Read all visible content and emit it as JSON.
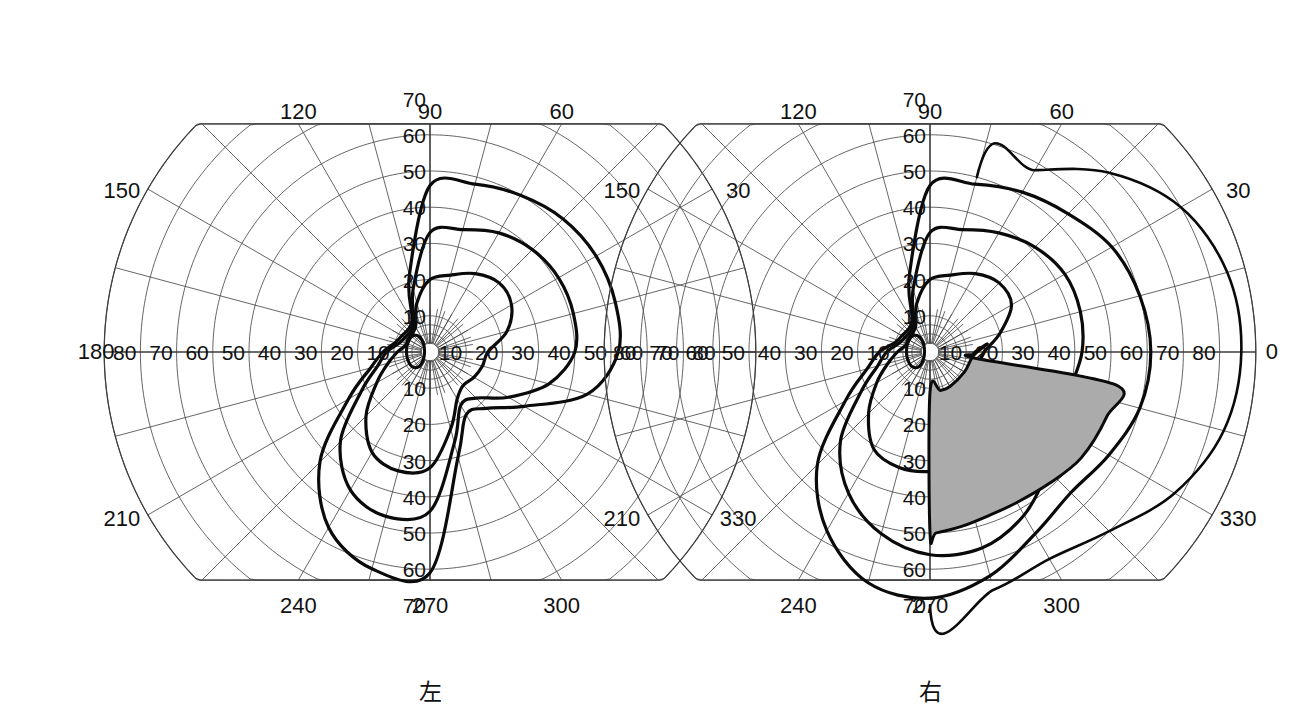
{
  "figure": {
    "background_color": "#ffffff",
    "line_color": "#3c3c3c",
    "isopter_color": "#0a0a0a",
    "scotoma_fill": "#ababab"
  },
  "panels": [
    {
      "id": "left-eye",
      "eye_label": "左",
      "eye_label_meaning": "left",
      "center_x": 430,
      "center_y": 352
    },
    {
      "id": "right-eye",
      "eye_label": "右",
      "eye_label_meaning": "right",
      "center_x": 930,
      "center_y": 352
    }
  ],
  "meridian_labels": {
    "top": [
      "120",
      "90",
      "60"
    ],
    "upper_side": [
      "150",
      "30"
    ],
    "horizontal": [
      "180",
      "0"
    ],
    "lower_side": [
      "210",
      "330"
    ],
    "bottom": [
      "240",
      "270",
      "300"
    ]
  },
  "radial_tick_labels": {
    "vertical_up": [
      "70",
      "60",
      "50",
      "40",
      "30",
      "20",
      "10"
    ],
    "vertical_down": [
      "10",
      "20",
      "30",
      "40",
      "50",
      "60",
      "70"
    ],
    "horizontal_left_panel": [
      "180",
      "80",
      "70",
      "60",
      "50",
      "40",
      "30",
      "20",
      "10",
      "10",
      "20",
      "30",
      "40",
      "50",
      "60"
    ],
    "horizontal_right_panel": [
      "60",
      "50",
      "40",
      "30",
      "20",
      "10",
      "10",
      "20",
      "30",
      "40",
      "50",
      "60",
      "70",
      "80",
      "0"
    ]
  },
  "axis": {
    "unit": "degrees",
    "radial_range": [
      0,
      90
    ],
    "radial_major_step": 10,
    "angular_major_step": 30,
    "angular_minor_step": 15,
    "inner_angular_fine_step": 10
  },
  "chart_data": {
    "type": "line",
    "subtitle": "Left eye (左) and Right eye (右) isopters with inferior-nasal scotoma on right eye",
    "xlabel": "Horizontal meridian (degrees)",
    "ylabel": "Vertical meridian (degrees)",
    "projection": "polar",
    "legend_position": "none",
    "grid": true,
    "radial_ticks": [
      10,
      20,
      30,
      40,
      50,
      60,
      70,
      80,
      90
    ],
    "angular_ticks": [
      0,
      30,
      60,
      90,
      120,
      150,
      180,
      210,
      240,
      270,
      300,
      330
    ],
    "panels": [
      {
        "name": "left-eye",
        "label": "左",
        "series": [
          {
            "name": "outer-isopter",
            "description": "Largest isopter, left eye",
            "points_deg": [
              {
                "angle": 90,
                "r": 46
              },
              {
                "angle": 75,
                "r": 48
              },
              {
                "angle": 60,
                "r": 50
              },
              {
                "angle": 45,
                "r": 52
              },
              {
                "angle": 30,
                "r": 53
              },
              {
                "angle": 15,
                "r": 53
              },
              {
                "angle": 0,
                "r": 52
              },
              {
                "angle": 345,
                "r": 45
              },
              {
                "angle": 330,
                "r": 30
              },
              {
                "angle": 315,
                "r": 22
              },
              {
                "angle": 300,
                "r": 20
              },
              {
                "angle": 285,
                "r": 30
              },
              {
                "angle": 270,
                "r": 61
              },
              {
                "angle": 255,
                "r": 62
              },
              {
                "angle": 240,
                "r": 56
              },
              {
                "angle": 225,
                "r": 43
              },
              {
                "angle": 210,
                "r": 26
              },
              {
                "angle": 195,
                "r": 17
              },
              {
                "angle": 180,
                "r": 13
              },
              {
                "angle": 165,
                "r": 10
              },
              {
                "angle": 150,
                "r": 9
              },
              {
                "angle": 120,
                "r": 10
              },
              {
                "angle": 105,
                "r": 22
              }
            ]
          },
          {
            "name": "middle-isopter",
            "description": "Intermediate isopter, left eye",
            "points_deg": [
              {
                "angle": 90,
                "r": 33
              },
              {
                "angle": 75,
                "r": 35
              },
              {
                "angle": 60,
                "r": 38
              },
              {
                "angle": 45,
                "r": 40
              },
              {
                "angle": 30,
                "r": 41
              },
              {
                "angle": 15,
                "r": 41
              },
              {
                "angle": 0,
                "r": 40
              },
              {
                "angle": 345,
                "r": 34
              },
              {
                "angle": 330,
                "r": 25
              },
              {
                "angle": 315,
                "r": 18
              },
              {
                "angle": 300,
                "r": 17
              },
              {
                "angle": 285,
                "r": 26
              },
              {
                "angle": 270,
                "r": 44
              },
              {
                "angle": 255,
                "r": 47
              },
              {
                "angle": 240,
                "r": 44
              },
              {
                "angle": 225,
                "r": 35
              },
              {
                "angle": 210,
                "r": 22
              },
              {
                "angle": 195,
                "r": 15
              },
              {
                "angle": 180,
                "r": 12
              },
              {
                "angle": 165,
                "r": 9
              },
              {
                "angle": 150,
                "r": 8
              },
              {
                "angle": 120,
                "r": 9
              },
              {
                "angle": 105,
                "r": 18
              }
            ]
          },
          {
            "name": "inner-isopter",
            "description": "Smallest isopter, left eye",
            "points_deg": [
              {
                "angle": 90,
                "r": 20
              },
              {
                "angle": 75,
                "r": 22
              },
              {
                "angle": 60,
                "r": 25
              },
              {
                "angle": 45,
                "r": 27
              },
              {
                "angle": 30,
                "r": 26
              },
              {
                "angle": 15,
                "r": 22
              },
              {
                "angle": 0,
                "r": 16
              },
              {
                "angle": 345,
                "r": 15
              },
              {
                "angle": 330,
                "r": 14
              },
              {
                "angle": 315,
                "r": 13
              },
              {
                "angle": 300,
                "r": 15
              },
              {
                "angle": 285,
                "r": 22
              },
              {
                "angle": 270,
                "r": 32
              },
              {
                "angle": 255,
                "r": 34
              },
              {
                "angle": 240,
                "r": 32
              },
              {
                "angle": 225,
                "r": 25
              },
              {
                "angle": 210,
                "r": 17
              },
              {
                "angle": 195,
                "r": 12
              },
              {
                "angle": 180,
                "r": 9
              },
              {
                "angle": 165,
                "r": 7
              },
              {
                "angle": 150,
                "r": 7
              },
              {
                "angle": 120,
                "r": 8
              },
              {
                "angle": 105,
                "r": 14
              }
            ]
          },
          {
            "name": "blind-spot",
            "description": "Physiologic blind spot (central oval)",
            "center_deg": {
              "angle": 178,
              "r": 4
            },
            "width_deg": 5,
            "height_deg": 9
          }
        ]
      },
      {
        "name": "right-eye",
        "label": "右",
        "series": [
          {
            "name": "outermost-isopter",
            "description": "Largest isopter, right eye, extending temporally to ~85 deg",
            "points_deg": [
              {
                "angle": 75,
                "r": 50
              },
              {
                "angle": 60,
                "r": 58
              },
              {
                "angle": 45,
                "r": 70
              },
              {
                "angle": 30,
                "r": 80
              },
              {
                "angle": 15,
                "r": 85
              },
              {
                "angle": 0,
                "r": 86
              },
              {
                "angle": 345,
                "r": 84
              },
              {
                "angle": 330,
                "r": 78
              },
              {
                "angle": 315,
                "r": 70
              },
              {
                "angle": 300,
                "r": 66
              },
              {
                "angle": 285,
                "r": 68
              },
              {
                "angle": 270,
                "r": 70
              }
            ]
          },
          {
            "name": "outer-isopter",
            "description": "Second isopter, right eye",
            "points_deg": [
              {
                "angle": 90,
                "r": 46
              },
              {
                "angle": 75,
                "r": 48
              },
              {
                "angle": 60,
                "r": 51
              },
              {
                "angle": 45,
                "r": 54
              },
              {
                "angle": 30,
                "r": 58
              },
              {
                "angle": 15,
                "r": 60
              },
              {
                "angle": 0,
                "r": 61
              },
              {
                "angle": 345,
                "r": 60
              },
              {
                "angle": 330,
                "r": 57
              },
              {
                "angle": 315,
                "r": 55
              },
              {
                "angle": 300,
                "r": 58
              },
              {
                "angle": 285,
                "r": 64
              },
              {
                "angle": 270,
                "r": 68
              },
              {
                "angle": 255,
                "r": 66
              },
              {
                "angle": 240,
                "r": 57
              },
              {
                "angle": 225,
                "r": 44
              },
              {
                "angle": 210,
                "r": 27
              },
              {
                "angle": 195,
                "r": 18
              },
              {
                "angle": 180,
                "r": 14
              },
              {
                "angle": 165,
                "r": 10
              },
              {
                "angle": 150,
                "r": 9
              },
              {
                "angle": 120,
                "r": 10
              },
              {
                "angle": 105,
                "r": 22
              }
            ]
          },
          {
            "name": "middle-isopter",
            "description": "Intermediate isopter, right eye",
            "points_deg": [
              {
                "angle": 90,
                "r": 33
              },
              {
                "angle": 75,
                "r": 35
              },
              {
                "angle": 60,
                "r": 38
              },
              {
                "angle": 45,
                "r": 41
              },
              {
                "angle": 30,
                "r": 43
              },
              {
                "angle": 15,
                "r": 43
              },
              {
                "angle": 0,
                "r": 42
              },
              {
                "angle": 345,
                "r": 40
              },
              {
                "angle": 330,
                "r": 41
              },
              {
                "angle": 315,
                "r": 46
              },
              {
                "angle": 300,
                "r": 52
              },
              {
                "angle": 285,
                "r": 56
              },
              {
                "angle": 270,
                "r": 56
              },
              {
                "angle": 255,
                "r": 52
              },
              {
                "angle": 240,
                "r": 45
              },
              {
                "angle": 225,
                "r": 35
              },
              {
                "angle": 210,
                "r": 22
              },
              {
                "angle": 195,
                "r": 15
              },
              {
                "angle": 180,
                "r": 12
              },
              {
                "angle": 165,
                "r": 9
              },
              {
                "angle": 150,
                "r": 8
              },
              {
                "angle": 120,
                "r": 9
              },
              {
                "angle": 105,
                "r": 18
              }
            ]
          },
          {
            "name": "inner-isopter",
            "description": "Smallest isopter, right eye",
            "points_deg": [
              {
                "angle": 90,
                "r": 20
              },
              {
                "angle": 75,
                "r": 22
              },
              {
                "angle": 60,
                "r": 25
              },
              {
                "angle": 45,
                "r": 27
              },
              {
                "angle": 30,
                "r": 26
              },
              {
                "angle": 15,
                "r": 20
              },
              {
                "angle": 0,
                "r": 15
              },
              {
                "angle": 345,
                "r": 14
              },
              {
                "angle": 330,
                "r": 16
              },
              {
                "angle": 315,
                "r": 22
              },
              {
                "angle": 300,
                "r": 28
              },
              {
                "angle": 285,
                "r": 32
              },
              {
                "angle": 270,
                "r": 33
              },
              {
                "angle": 255,
                "r": 33
              },
              {
                "angle": 240,
                "r": 31
              },
              {
                "angle": 225,
                "r": 24
              },
              {
                "angle": 210,
                "r": 17
              },
              {
                "angle": 195,
                "r": 12
              },
              {
                "angle": 180,
                "r": 9
              },
              {
                "angle": 165,
                "r": 7
              },
              {
                "angle": 150,
                "r": 7
              },
              {
                "angle": 120,
                "r": 8
              },
              {
                "angle": 105,
                "r": 14
              }
            ]
          },
          {
            "name": "scotoma",
            "description": "Shaded absolute scotoma, inferior-temporal quadrant, right eye",
            "fill": "#ababab",
            "extent_deg": {
              "angle_from": 270,
              "angle_to": 10,
              "r_max": 52,
              "r_min": 11
            },
            "boundary_points_deg": [
              {
                "angle": 8,
                "r": 16
              },
              {
                "angle": 2,
                "r": 13
              },
              {
                "angle": 357,
                "r": 12
              },
              {
                "angle": 352,
                "r": 13
              },
              {
                "angle": 350,
                "r": 52
              },
              {
                "angle": 340,
                "r": 52
              },
              {
                "angle": 325,
                "r": 51
              },
              {
                "angle": 312,
                "r": 49
              },
              {
                "angle": 300,
                "r": 48
              },
              {
                "angle": 290,
                "r": 48
              },
              {
                "angle": 280,
                "r": 49
              },
              {
                "angle": 272,
                "r": 50
              },
              {
                "angle": 270,
                "r": 50
              },
              {
                "angle": 270,
                "r": 11
              },
              {
                "angle": 285,
                "r": 11
              },
              {
                "angle": 300,
                "r": 11
              },
              {
                "angle": 330,
                "r": 11
              },
              {
                "angle": 355,
                "r": 12
              }
            ]
          },
          {
            "name": "blind-spot",
            "description": "Physiologic blind spot (central oval)",
            "center_deg": {
              "angle": 178,
              "r": 4
            },
            "width_deg": 5,
            "height_deg": 9
          }
        ]
      }
    ]
  }
}
